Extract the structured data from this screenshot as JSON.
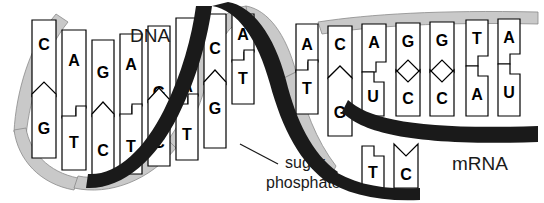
{
  "figure": {
    "title_label": "DNA",
    "mrna_label": "mRNA",
    "callout_line1": "sugar",
    "callout_line2": "phosphate",
    "background": "#ffffff",
    "front_backbone_color": "#1a1a1a",
    "back_backbone_color": "#c9c9c9",
    "base_fill": "#ffffff",
    "base_stroke": "#000000",
    "text_color": "#1a1a1a"
  },
  "helix": {
    "paired_region": [
      {
        "top": "C",
        "bottom": "G",
        "notch": "chevron"
      },
      {
        "top": "A",
        "bottom": "T",
        "notch": "step"
      },
      {
        "top": "G",
        "bottom": "C",
        "notch": "chevron"
      },
      {
        "top": "A",
        "bottom": "T",
        "notch": "step"
      },
      {
        "top": "G",
        "bottom": "C",
        "notch": "chevron"
      },
      {
        "top": "A",
        "bottom": "T",
        "notch": "step"
      },
      {
        "top": "C",
        "bottom": "G",
        "notch": "chevron"
      },
      {
        "top": "A",
        "bottom": "T",
        "notch": "step"
      },
      {
        "top": "A",
        "bottom": "T",
        "notch": "step"
      }
    ],
    "unwound_top_strand": [
      "C",
      "A",
      "G",
      "G",
      "T",
      "A"
    ],
    "unwound_bottom_strand": [
      "G",
      "T",
      "C"
    ],
    "mrna_strand": [
      "U",
      "C",
      "C",
      "A",
      "U"
    ]
  },
  "legend": {
    "pairing_rule_dna": "A-T, C-G",
    "pairing_rule_rna": "A-U, C-G"
  }
}
